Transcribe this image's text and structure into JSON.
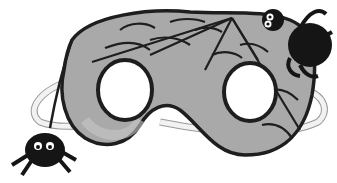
{
  "image": {
    "subject": "spider-web mask",
    "description": "Grayscale illustration of a Halloween eye mask decorated with a rope-outlined spider web, two fuzzy spiders (one on top-right, one dangling at bottom-left) and an elastic band",
    "colors": {
      "background": "#ffffff",
      "mask_fill": "#a9a9a9",
      "mask_highlight": "#c8c8c8",
      "rope": "#1e1e1e",
      "spider": "#151515",
      "band": "#f2f2f2",
      "eye_holes": "#ffffff"
    }
  }
}
